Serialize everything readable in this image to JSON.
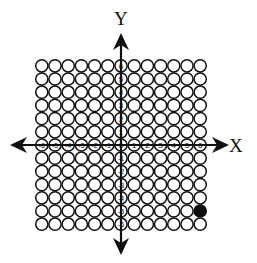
{
  "diagram": {
    "x_axis_label": "X",
    "y_axis_label": "Y",
    "x_range": [
      -6,
      6
    ],
    "y_range": [
      -6,
      6
    ],
    "x_tick_labels": [
      "-6",
      "-5",
      "-4",
      "-3",
      "-2",
      "-1",
      "0",
      "1",
      "2",
      "3",
      "4",
      "5",
      "6"
    ],
    "y_tick_labels": [
      "6",
      "5",
      "4",
      "3",
      "2",
      "1",
      "-1",
      "-2",
      "-3",
      "-4",
      "-5",
      "-6"
    ],
    "filled_points": [
      {
        "x": 6,
        "y": -5
      }
    ],
    "colors": {
      "stroke": "#111111",
      "fill_empty": "#ffffff",
      "fill_marked": "#111111"
    }
  }
}
